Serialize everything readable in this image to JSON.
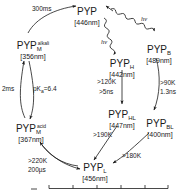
{
  "figure": {
    "background_color": "#ffffff",
    "stroke_color": "#1a1a1a",
    "text_color": "#1a1a1a"
  },
  "states": [
    {
      "id": "pyp",
      "symbol": "PYP",
      "subscript": "",
      "superscript": "",
      "wavelength": "[446nm]"
    },
    {
      "id": "pyp-b",
      "symbol": "PYP",
      "subscript": "B",
      "superscript": "",
      "wavelength": "[489nm]"
    },
    {
      "id": "pyp-h",
      "symbol": "PYP",
      "subscript": "H",
      "superscript": "",
      "wavelength": "[442nm]"
    },
    {
      "id": "pyp-hl",
      "symbol": "PYP",
      "subscript": "HL",
      "superscript": "",
      "wavelength": "[447nm]"
    },
    {
      "id": "pyp-bl",
      "symbol": "PYP",
      "subscript": "BL",
      "superscript": "",
      "wavelength": "[400nm]"
    },
    {
      "id": "pyp-l",
      "symbol": "PYP",
      "subscript": "L",
      "superscript": "",
      "wavelength": "[456nm]"
    },
    {
      "id": "pyp-m-acid",
      "symbol": "PYP",
      "subscript": "M",
      "superscript": "acid",
      "wavelength": "[367nm]"
    },
    {
      "id": "pyp-m-alkali",
      "symbol": "PYP",
      "subscript": "M",
      "superscript": "alkali",
      "wavelength": "[356nm]"
    }
  ],
  "transitions": [
    {
      "id": "m-alkali-to-pyp",
      "from": "pyp-m-alkali",
      "to": "pyp",
      "label_line1": "300ms",
      "label_line2": "",
      "kind": "curved-arrow"
    },
    {
      "id": "pyp-to-b",
      "from": "pyp",
      "to": "pyp-b",
      "label_line1": "hv",
      "label_line2": "",
      "kind": "photon-squiggle"
    },
    {
      "id": "pyp-to-h",
      "from": "pyp",
      "to": "pyp-h",
      "label_line1": "hv",
      "label_line2": "",
      "kind": "photon-squiggle"
    },
    {
      "id": "b-to-bl",
      "from": "pyp-b",
      "to": "pyp-bl",
      "label_line1": ">90K",
      "label_line2": "1.3ns",
      "kind": "curved-arrow"
    },
    {
      "id": "h-to-hl",
      "from": "pyp-h",
      "to": "pyp-hl",
      "label_line1": ">120K",
      "label_line2": ">5ns",
      "kind": "straight-arrow"
    },
    {
      "id": "hl-to-l",
      "from": "pyp-hl",
      "to": "pyp-l",
      "label_line1": ">190K",
      "label_line2": "",
      "kind": "straight-arrow"
    },
    {
      "id": "bl-to-l",
      "from": "pyp-bl",
      "to": "pyp-l",
      "label_line1": ">180K",
      "label_line2": "",
      "kind": "curved-arrow"
    },
    {
      "id": "l-to-m-acid",
      "from": "pyp-l",
      "to": "pyp-m-acid",
      "label_line1": ">220K",
      "label_line2": "200µs",
      "kind": "curved-double-arrow"
    },
    {
      "id": "m-acid-to-m-alkali",
      "from": "pyp-m-acid",
      "to": "pyp-m-alkali",
      "label_line1": "2ms",
      "label_line2": "",
      "kind": "curved-equilibrium"
    },
    {
      "id": "m-equilibrium-pka",
      "from": "pyp-m-alkali",
      "to": "pyp-m-acid",
      "label_line1": "pKa=6.4",
      "label_line2": "",
      "kind": "curved-equilibrium"
    }
  ],
  "annotations": {
    "t_300ms": "300ms",
    "hv_right": "hν",
    "hv_left": "hν",
    "t_90k": ">90K",
    "t_13ns": "1.3ns",
    "t_120k": ">120K",
    "t_5ns": ">5ns",
    "t_190k": ">190K",
    "t_180k": ">180K",
    "t_220k": ">220K",
    "t_200us": "200µs",
    "t_2ms": "2ms",
    "pka_prefix": "pK",
    "pka_sub": "a",
    "pka_value": "=6.4"
  },
  "bottom_panel": {
    "visible": true,
    "description": "cropped axis of adjacent panel",
    "tick_count": 6
  }
}
